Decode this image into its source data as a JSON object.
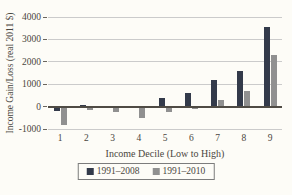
{
  "figure": {
    "background_color": "#fdfcf7",
    "text_color": "#4a4640"
  },
  "chart_data": {
    "type": "bar",
    "title": "",
    "categories": [
      "1",
      "2",
      "3",
      "4",
      "5",
      "6",
      "7",
      "8",
      "9"
    ],
    "series": [
      {
        "name": "1991–2008",
        "color": "#333a4a",
        "values": [
          -200,
          50,
          -50,
          -50,
          400,
          600,
          1200,
          1600,
          3550
        ]
      },
      {
        "name": "1991–2010",
        "color": "#909090",
        "values": [
          -800,
          -150,
          -250,
          -500,
          -250,
          -100,
          300,
          700,
          2300
        ]
      }
    ],
    "xlabel": "Income Decile (Low to High)",
    "ylabel": "Income Gain/Loss (real 2011 $)",
    "ylim": [
      -1000,
      4000
    ],
    "yticks": [
      4000,
      3000,
      2000,
      1000,
      0,
      -1000
    ],
    "grid": true,
    "gridline_color": "#cbcbcb",
    "zero_line_color": "#4f4b44",
    "legend_position": "bottom",
    "legend_bordered": true
  }
}
